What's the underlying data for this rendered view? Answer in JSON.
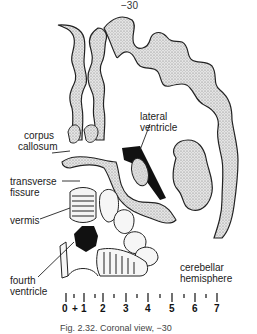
{
  "figure": {
    "section_label": "−30",
    "labels": {
      "corpus_callosum": [
        "corpus",
        "callosum"
      ],
      "lateral_ventricle": [
        "lateral",
        "ventricle"
      ],
      "transverse_fissure": [
        "transverse",
        "fissure"
      ],
      "vermis": [
        "vermis"
      ],
      "fourth_ventricle": [
        "fourth",
        "ventricle"
      ],
      "cerebellar_hemisphere": [
        "cerebellar",
        "hemisphere"
      ]
    },
    "scale": {
      "ticks": [
        "0",
        "+",
        "1",
        "2",
        "3",
        "4",
        "5",
        "6",
        "7"
      ]
    },
    "caption": "Fig. 2.32. Coronal view, −30"
  }
}
